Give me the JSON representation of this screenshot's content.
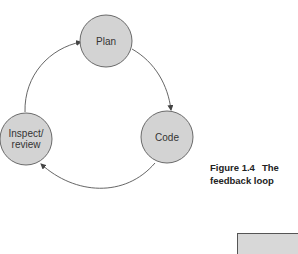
{
  "diagram": {
    "nodes": [
      {
        "id": "plan",
        "label_lines": [
          "Plan"
        ]
      },
      {
        "id": "code",
        "label_lines": [
          "Code"
        ]
      },
      {
        "id": "inspect",
        "label_lines": [
          "Inspect/",
          "review"
        ]
      }
    ],
    "edges": [
      {
        "from": "plan",
        "to": "code"
      },
      {
        "from": "code",
        "to": "inspect"
      },
      {
        "from": "inspect",
        "to": "plan"
      }
    ],
    "colors": {
      "node_fill": "#d3d3d3",
      "node_stroke": "#6a6a6a",
      "edge": "#555555",
      "text": "#333333"
    }
  },
  "caption": {
    "figure_number": "Figure 1.4",
    "title_line1": "The",
    "title_line2": "feedback loop"
  }
}
